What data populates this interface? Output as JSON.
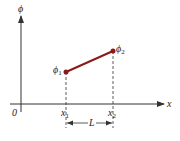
{
  "diagram": {
    "axes": {
      "y_label": "ϕ",
      "x_label": "x",
      "origin_label": "0"
    },
    "points": [
      {
        "name": "phi1",
        "label": "ϕ",
        "subscript": "1",
        "x_label": "x",
        "x_subscript": "1"
      },
      {
        "name": "phi2",
        "label": "ϕ",
        "subscript": "2",
        "x_label": "x",
        "x_subscript": "2"
      }
    ],
    "segment_color": "#8b1a1a",
    "dimension_label": "L"
  }
}
